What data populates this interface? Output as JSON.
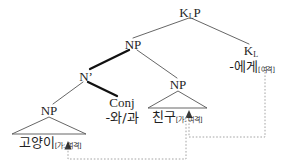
{
  "diagram": {
    "type": "syntax-tree",
    "background": "#ffffff",
    "line_color": "#555555",
    "bold_line_color": "#111111",
    "dotted_color": "#9a9a9a",
    "feature_color": "#6f6f6f"
  },
  "nodes": {
    "klp": {
      "label": "K",
      "sub": "L",
      "tail": "P"
    },
    "np_top": {
      "label": "NP"
    },
    "kl": {
      "label": "K",
      "sub": "L"
    },
    "kl_morph": {
      "text": "-에게",
      "feature": "[여격]"
    },
    "nbar": {
      "label": "N’"
    },
    "np_left": {
      "label": "NP"
    },
    "np_right": {
      "label": "NP"
    },
    "conj": {
      "label": "Conj",
      "morph": "-와/과"
    },
    "cat_word": {
      "text": "고양이",
      "feature_case": "[가: ",
      "feature_dat": "여격]"
    },
    "friend_word": {
      "text": "친구",
      "feature_case": "[가: ",
      "feature_dat": "여격]"
    }
  },
  "edges": [
    {
      "name": "klp-to-np",
      "from": "klp",
      "to": "np_top",
      "weight": "thin"
    },
    {
      "name": "klp-to-kl",
      "from": "klp",
      "to": "kl",
      "weight": "thin"
    },
    {
      "name": "np-to-nbar",
      "from": "np_top",
      "to": "nbar",
      "weight": "bold"
    },
    {
      "name": "np-to-np-right",
      "from": "np_top",
      "to": "np_right",
      "weight": "thin"
    },
    {
      "name": "nbar-to-np-left",
      "from": "nbar",
      "to": "np_left",
      "weight": "thin"
    },
    {
      "name": "nbar-to-conj",
      "from": "nbar",
      "to": "conj",
      "weight": "bold"
    }
  ],
  "triangles": [
    {
      "name": "triangle-np-left",
      "apex": "np_left",
      "base_word": "고양이[가: 여격]"
    },
    {
      "name": "triangle-np-right",
      "apex": "np_right",
      "base_word": "친구[가: 여격]"
    }
  ],
  "dependency_arrows": [
    {
      "name": "arrow-kl-to-friend",
      "from": "K_L -에게[여격]",
      "to": "친구[가: 여격]",
      "style": "dotted"
    },
    {
      "name": "arrow-friend-to-cat",
      "from": "친구[가: 여격]",
      "to": "고양이[가: 여격]",
      "style": "dotted"
    }
  ]
}
